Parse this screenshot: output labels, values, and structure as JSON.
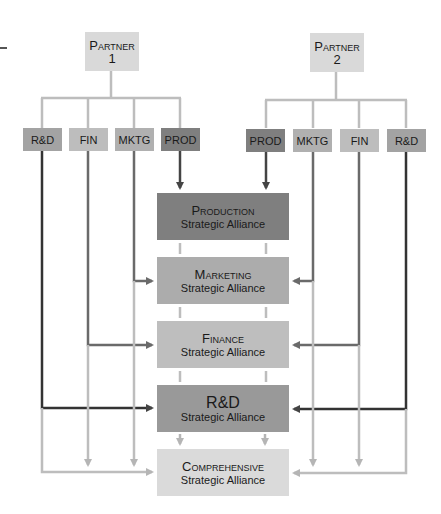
{
  "colors": {
    "partner_box": "#d9d9d9",
    "dept_rd": "#a3a3a3",
    "dept_fin": "#bdbdbd",
    "dept_mktg": "#b0b0b0",
    "dept_prod": "#7f7f7f",
    "alliance_production": "#7f7f7f",
    "alliance_marketing": "#acacac",
    "alliance_finance": "#bebebe",
    "alliance_rd": "#999999",
    "alliance_comprehensive": "#dadada",
    "line_dark": "#333333",
    "line_mid": "#6a6a6a",
    "line_light": "#bdbdbd"
  },
  "partners": [
    {
      "label": "Partner",
      "number": "1"
    },
    {
      "label": "Partner",
      "number": "2"
    }
  ],
  "partner1_depts": [
    {
      "label": "R&D"
    },
    {
      "label": "FIN"
    },
    {
      "label": "MKTG"
    },
    {
      "label": "PROD"
    }
  ],
  "partner2_depts": [
    {
      "label": "PROD"
    },
    {
      "label": "MKTG"
    },
    {
      "label": "FIN"
    },
    {
      "label": "R&D"
    }
  ],
  "alliances": [
    {
      "title": "Production",
      "subtitle": "Strategic Alliance"
    },
    {
      "title": "Marketing",
      "subtitle": "Strategic Alliance"
    },
    {
      "title": "Finance",
      "subtitle": "Strategic Alliance"
    },
    {
      "title": "R&D",
      "subtitle": "Strategic Alliance"
    },
    {
      "title": "Comprehensive",
      "subtitle": "Strategic Alliance"
    }
  ]
}
